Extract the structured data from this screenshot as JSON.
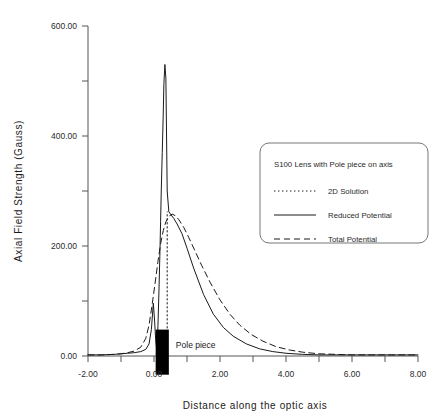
{
  "chart_data": {
    "type": "line",
    "title": "",
    "xlabel": "Distance along the optic axis",
    "ylabel": "Axial Field Strength (Gauss)",
    "xlim": [
      -2.0,
      8.0
    ],
    "ylim": [
      0.0,
      600.0
    ],
    "grid": false,
    "x_ticks": [
      -2.0,
      -1.0,
      0.0,
      1.0,
      2.0,
      3.0,
      4.0,
      5.0,
      6.0,
      7.0,
      8.0
    ],
    "x_tick_labels": [
      "-2.00",
      "",
      "0.00",
      "",
      "2.00",
      "",
      "4.00",
      "",
      "6.00",
      "",
      "8.00"
    ],
    "y_ticks": [
      0.0,
      100.0,
      200.0,
      300.0,
      400.0,
      500.0,
      600.0
    ],
    "y_tick_labels": [
      "0.00",
      "",
      "200.00",
      "",
      "400.00",
      "",
      "600.00"
    ],
    "legend_position": "upper right",
    "legend_title": "S100 Lens with Pole piece on axis",
    "series": [
      {
        "name": "2D Solution",
        "style": "dotted",
        "x": [
          0.4,
          0.4,
          0.4,
          0.4,
          0.4,
          0.4
        ],
        "values": [
          0.0,
          60.0,
          120.0,
          180.0,
          230.0,
          262.0
        ]
      },
      {
        "name": "Reduced Potential",
        "style": "solid",
        "x": [
          -2.0,
          -1.6,
          -1.2,
          -1.0,
          -0.8,
          -0.6,
          -0.4,
          -0.25,
          -0.15,
          -0.08,
          -0.02,
          0.02,
          0.05,
          0.08,
          0.1,
          0.12,
          0.15,
          0.18,
          0.2,
          0.22,
          0.25,
          0.28,
          0.3,
          0.33,
          0.36,
          0.4,
          0.45,
          0.5,
          0.6,
          0.7,
          0.85,
          1.0,
          1.2,
          1.5,
          1.8,
          2.1,
          2.4,
          2.8,
          3.2,
          3.6,
          4.0,
          4.5,
          5.0,
          5.6,
          6.2,
          7.0,
          8.0
        ],
        "values": [
          2.0,
          2.0,
          3.0,
          4.0,
          5.0,
          6.0,
          8.0,
          12.0,
          22.0,
          48.0,
          96.0,
          62.0,
          30.0,
          14.0,
          22.0,
          55.0,
          118.0,
          190.0,
          245.0,
          300.0,
          370.0,
          440.0,
          495.0,
          530.0,
          505.0,
          300.0,
          262.0,
          258.0,
          250.0,
          240.0,
          222.0,
          196.0,
          160.0,
          112.0,
          76.0,
          52.0,
          36.0,
          22.0,
          13.0,
          8.0,
          5.0,
          3.0,
          2.0,
          2.0,
          2.0,
          2.0,
          2.0
        ]
      },
      {
        "name": "Total Potential",
        "style": "dashed",
        "x": [
          -2.0,
          -1.6,
          -1.2,
          -1.0,
          -0.8,
          -0.6,
          -0.4,
          -0.25,
          -0.15,
          -0.05,
          0.05,
          0.12,
          0.2,
          0.28,
          0.36,
          0.45,
          0.55,
          0.65,
          0.75,
          0.9,
          1.05,
          1.25,
          1.45,
          1.7,
          2.0,
          2.3,
          2.6,
          2.95,
          3.3,
          3.7,
          4.1,
          4.5,
          5.0,
          5.5,
          6.0,
          6.6,
          7.2,
          8.0
        ],
        "values": [
          2.0,
          2.0,
          3.0,
          4.0,
          6.0,
          9.0,
          16.0,
          32.0,
          56.0,
          96.0,
          140.0,
          172.0,
          204.0,
          228.0,
          244.0,
          254.0,
          258.0,
          255.0,
          248.0,
          234.0,
          216.0,
          190.0,
          164.0,
          134.0,
          102.0,
          76.0,
          56.0,
          39.0,
          27.0,
          17.0,
          11.0,
          7.0,
          4.0,
          3.0,
          2.0,
          2.0,
          2.0,
          2.0
        ]
      }
    ],
    "annotations": [
      {
        "name": "pole-piece",
        "label": "Pole piece",
        "x_start": 0.05,
        "x_end": 0.45,
        "y_top": 48.0,
        "y_bottom": -34.0,
        "fill": "#000000"
      }
    ]
  },
  "legend": {
    "title": "S100 Lens with Pole piece on axis",
    "entries": [
      {
        "label": "2D Solution",
        "style": "dotted"
      },
      {
        "label": "Reduced Potential",
        "style": "solid"
      },
      {
        "label": "Total Potential",
        "style": "dashed"
      }
    ]
  },
  "axes": {
    "x_title": "Distance along the optic axis",
    "y_title": "Axial Field Strength (Gauss)",
    "x_labels": [
      "-2.00",
      "0.00",
      "2.00",
      "4.00",
      "6.00",
      "8.00"
    ],
    "y_labels": [
      "600.00",
      "400.00",
      "200.00",
      "0.00"
    ]
  },
  "annotations": {
    "pole_piece_label": "Pole piece"
  },
  "colors": {
    "line": "#1a1a1a",
    "axis": "#555555",
    "background": "#ffffff",
    "pole_piece": "#000000",
    "legend_border": "#777777"
  }
}
